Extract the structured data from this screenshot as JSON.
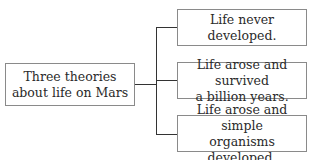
{
  "diagram": {
    "root": {
      "label": "Three theories about life on Mars",
      "lines": [
        "Three theories",
        "about life on Mars"
      ]
    },
    "branches": [
      {
        "label": "Life never developed.",
        "lines": [
          "Life never",
          "developed."
        ]
      },
      {
        "label": "Life arose and survived a billion years.",
        "lines": [
          "Life arose and survived",
          "a billion years."
        ]
      },
      {
        "label": "Life arose and simple organisms developed.",
        "lines": [
          "Life arose and simple",
          "organisms developed."
        ]
      }
    ]
  }
}
